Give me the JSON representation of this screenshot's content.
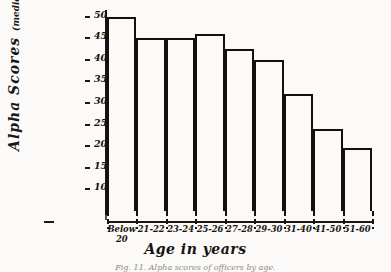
{
  "chart_data": {
    "type": "bar",
    "title": "",
    "xlabel": "Age in years",
    "ylabel": "Alpha Scores (median)",
    "ylabel_main": "Alpha Scores",
    "ylabel_paren": "(median)",
    "categories": [
      "Below 20",
      "21-22",
      "23-24",
      "25-26",
      "27-28",
      "29-30",
      "31-40",
      "41-50",
      "51-60"
    ],
    "values": [
      50,
      45,
      45,
      46,
      42.5,
      40,
      32,
      24,
      19.5
    ],
    "ylim": [
      5,
      52
    ],
    "yticks": [
      50,
      45,
      40,
      35,
      30,
      25,
      20,
      15,
      10
    ],
    "ytick_labels": [
      "50",
      "45",
      "40",
      "35",
      "30",
      "25",
      "20",
      "15",
      "10"
    ],
    "grid": false,
    "legend": null
  },
  "caption": {
    "text": "Fig. 11. Alpha scores of officers by age."
  }
}
